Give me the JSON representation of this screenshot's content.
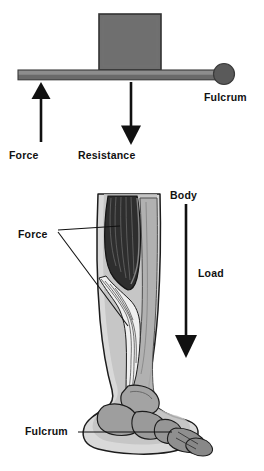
{
  "figure": {
    "panels": [
      {
        "id": "lever-schematic",
        "name": "Lever schematic",
        "labels": {
          "force": "Force",
          "resistance": "Resistance",
          "fulcrum": "Fulcrum"
        },
        "elements": {
          "beam": "lever beam",
          "weight_block": "resistance block",
          "fulcrum_pivot": "fulcrum pivot circle",
          "force_arrow_direction": "up",
          "resistance_arrow_direction": "down"
        }
      },
      {
        "id": "leg-anatomy",
        "name": "Lower leg and foot anatomy",
        "labels": {
          "force": "Force",
          "body": "Body",
          "load": "Load",
          "fulcrum": "Fulcrum"
        },
        "elements": {
          "calf_muscle": "gastrocnemius muscle",
          "achilles_tendon": "achilles tendon",
          "tibia": "tibia bone",
          "foot_bones": "tarsal and metatarsal bones",
          "load_arrow_direction": "down"
        }
      }
    ]
  },
  "colors": {
    "beam_top": "#8d8d8d",
    "beam_body": "#6e6e6e",
    "beam_outline": "#3a3a3a",
    "block_fill": "#6f6f6f",
    "block_outline": "#333333",
    "fulcrum_fill": "#5a5a5a",
    "arrow": "#111111",
    "text": "#111111",
    "skin": "#d8d8d8",
    "skin_mid": "#b4b4b4",
    "muscle_dark": "#2f2f2f",
    "muscle_mid": "#8a8a8a",
    "bone": "#9a9a9a",
    "tendon_light": "#f2f2f2",
    "outline": "#1c1c1c",
    "background": "#ffffff"
  }
}
